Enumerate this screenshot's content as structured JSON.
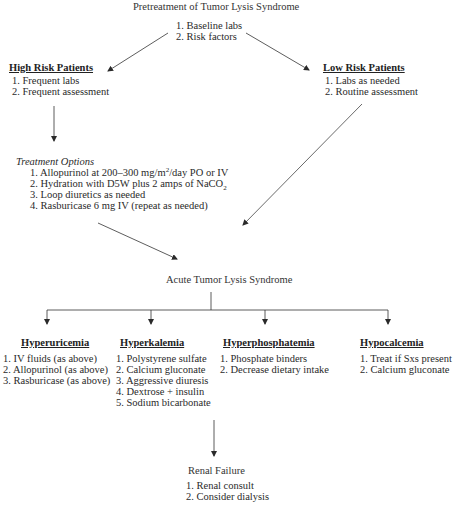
{
  "diagram": {
    "pretreatment": {
      "title": "Pretreatment of Tumor Lysis Syndrome",
      "items": [
        "1. Baseline labs",
        "2. Risk factors"
      ]
    },
    "high_risk": {
      "heading": "High Risk Patients",
      "items": [
        "1. Frequent labs",
        "2. Frequent assessment"
      ]
    },
    "low_risk": {
      "heading": "Low Risk Patients",
      "items": [
        "1. Labs as needed",
        "2. Routine assessment"
      ]
    },
    "treatment_options": {
      "heading": "Treatment Options",
      "items": [
        {
          "pre": "1. Allopurinol at 200–300 mg/m",
          "sup": "2",
          "post": "/day PO or IV"
        },
        {
          "pre": "2. Hydration with D5W plus 2 amps of NaCO",
          "sub": "2",
          "post": ""
        },
        {
          "pre": "3. Loop diuretics as needed",
          "post": ""
        },
        {
          "pre": "4. Rasburicase 6 mg IV (repeat as needed)",
          "post": ""
        }
      ]
    },
    "acute": {
      "title": "Acute Tumor Lysis Syndrome"
    },
    "branches": [
      {
        "heading": "Hyperuricemia",
        "items": [
          "1. IV fluids (as above)",
          "2. Allopurinol (as above)",
          "3. Rasburicase (as above)"
        ]
      },
      {
        "heading": "Hyperkalemia",
        "items": [
          "1. Polystyrene sulfate",
          "2. Calcium gluconate",
          "3. Aggressive diuresis",
          "4. Dextrose + insulin",
          "5. Sodium bicarbonate"
        ]
      },
      {
        "heading": "Hyperphosphatemia",
        "items": [
          "1. Phosphate binders",
          "2. Decrease dietary intake"
        ]
      },
      {
        "heading": "Hypocalcemia",
        "items": [
          "1. Treat if Sxs present",
          "2. Calcium gluconate"
        ]
      }
    ],
    "renal_failure": {
      "title": "Renal Failure",
      "items": [
        "1. Renal consult",
        "2. Consider dialysis"
      ]
    }
  },
  "colors": {
    "text": "#2a2a2a",
    "lines": "#333333",
    "background": "#ffffff"
  }
}
